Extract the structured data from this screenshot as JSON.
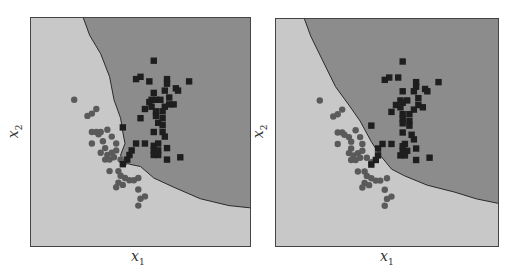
{
  "chart_data": [
    {
      "type": "scatter",
      "title": "",
      "xlabel": "x1",
      "ylabel": "x2",
      "ticks": "none",
      "grid": false,
      "legend": "none",
      "background_regions": {
        "class_circle": "#c8c8c8",
        "class_square": "#8c8c8c"
      },
      "decision_boundary": "irregular (nearest-neighbour style), jagged near clusters",
      "boundary_points": [
        [
          0.24,
          0
        ],
        [
          0.27,
          0.08
        ],
        [
          0.32,
          0.16
        ],
        [
          0.36,
          0.26
        ],
        [
          0.38,
          0.36
        ],
        [
          0.41,
          0.44
        ],
        [
          0.42,
          0.5
        ],
        [
          0.43,
          0.55
        ],
        [
          0.41,
          0.6
        ],
        [
          0.42,
          0.63
        ],
        [
          0.45,
          0.64
        ],
        [
          0.5,
          0.65
        ],
        [
          0.56,
          0.7
        ],
        [
          0.65,
          0.74
        ],
        [
          0.77,
          0.79
        ],
        [
          0.9,
          0.82
        ],
        [
          1.0,
          0.83
        ]
      ],
      "series": [
        {
          "name": "class circle",
          "marker": "circle",
          "color": "#5a5a5a",
          "points": [
            [
              0.2,
              0.36
            ],
            [
              0.26,
              0.43
            ],
            [
              0.28,
              0.42
            ],
            [
              0.3,
              0.4
            ],
            [
              0.28,
              0.5
            ],
            [
              0.3,
              0.5
            ],
            [
              0.31,
              0.51
            ],
            [
              0.32,
              0.5
            ],
            [
              0.35,
              0.49
            ],
            [
              0.28,
              0.55
            ],
            [
              0.33,
              0.54
            ],
            [
              0.37,
              0.52
            ],
            [
              0.34,
              0.57
            ],
            [
              0.39,
              0.55
            ],
            [
              0.32,
              0.59
            ],
            [
              0.35,
              0.6
            ],
            [
              0.37,
              0.59
            ],
            [
              0.39,
              0.58
            ],
            [
              0.34,
              0.62
            ],
            [
              0.36,
              0.62
            ],
            [
              0.38,
              0.61
            ],
            [
              0.41,
              0.62
            ],
            [
              0.36,
              0.67
            ],
            [
              0.4,
              0.67
            ],
            [
              0.43,
              0.63
            ],
            [
              0.41,
              0.69
            ],
            [
              0.43,
              0.7
            ],
            [
              0.45,
              0.71
            ],
            [
              0.49,
              0.7
            ],
            [
              0.47,
              0.71
            ],
            [
              0.4,
              0.72
            ],
            [
              0.39,
              0.74
            ],
            [
              0.42,
              0.73
            ],
            [
              0.49,
              0.75
            ],
            [
              0.5,
              0.79
            ],
            [
              0.52,
              0.78
            ],
            [
              0.49,
              0.82
            ]
          ]
        },
        {
          "name": "class square",
          "marker": "square",
          "color": "#1e1e1e",
          "points": [
            [
              0.56,
              0.19
            ],
            [
              0.48,
              0.27
            ],
            [
              0.5,
              0.26
            ],
            [
              0.54,
              0.28
            ],
            [
              0.62,
              0.27
            ],
            [
              0.62,
              0.29
            ],
            [
              0.72,
              0.28
            ],
            [
              0.66,
              0.31
            ],
            [
              0.67,
              0.32
            ],
            [
              0.56,
              0.33
            ],
            [
              0.61,
              0.32
            ],
            [
              0.63,
              0.35
            ],
            [
              0.55,
              0.36
            ],
            [
              0.54,
              0.37
            ],
            [
              0.57,
              0.36
            ],
            [
              0.59,
              0.36
            ],
            [
              0.63,
              0.38
            ],
            [
              0.65,
              0.38
            ],
            [
              0.61,
              0.39
            ],
            [
              0.52,
              0.4
            ],
            [
              0.55,
              0.39
            ],
            [
              0.57,
              0.41
            ],
            [
              0.6,
              0.41
            ],
            [
              0.57,
              0.43
            ],
            [
              0.6,
              0.44
            ],
            [
              0.5,
              0.44
            ],
            [
              0.58,
              0.46
            ],
            [
              0.6,
              0.47
            ],
            [
              0.42,
              0.48
            ],
            [
              0.56,
              0.5
            ],
            [
              0.6,
              0.5
            ],
            [
              0.61,
              0.52
            ],
            [
              0.58,
              0.55
            ],
            [
              0.48,
              0.55
            ],
            [
              0.52,
              0.55
            ],
            [
              0.56,
              0.56
            ],
            [
              0.56,
              0.58
            ],
            [
              0.58,
              0.58
            ],
            [
              0.62,
              0.57
            ],
            [
              0.46,
              0.58
            ],
            [
              0.45,
              0.6
            ],
            [
              0.56,
              0.6
            ],
            [
              0.58,
              0.6
            ],
            [
              0.62,
              0.62
            ],
            [
              0.68,
              0.61
            ],
            [
              0.44,
              0.62
            ],
            [
              0.42,
              0.64
            ]
          ]
        }
      ]
    },
    {
      "type": "scatter",
      "title": "",
      "xlabel": "x1",
      "ylabel": "x2",
      "ticks": "none",
      "grid": false,
      "legend": "none",
      "background_regions": {
        "class_circle": "#c8c8c8",
        "class_square": "#8c8c8c"
      },
      "decision_boundary": "smoother boundary",
      "boundary_points": [
        [
          0.13,
          0
        ],
        [
          0.16,
          0.08
        ],
        [
          0.21,
          0.18
        ],
        [
          0.27,
          0.3
        ],
        [
          0.33,
          0.38
        ],
        [
          0.38,
          0.45
        ],
        [
          0.43,
          0.54
        ],
        [
          0.47,
          0.6
        ],
        [
          0.52,
          0.66
        ],
        [
          0.58,
          0.69
        ],
        [
          0.68,
          0.73
        ],
        [
          0.8,
          0.76
        ],
        [
          0.9,
          0.79
        ],
        [
          1.0,
          0.81
        ]
      ],
      "series": [
        {
          "name": "class circle",
          "marker": "circle",
          "color": "#5a5a5a",
          "points": [
            [
              0.2,
              0.36
            ],
            [
              0.26,
              0.43
            ],
            [
              0.28,
              0.42
            ],
            [
              0.3,
              0.4
            ],
            [
              0.28,
              0.5
            ],
            [
              0.3,
              0.5
            ],
            [
              0.31,
              0.51
            ],
            [
              0.33,
              0.52
            ],
            [
              0.36,
              0.49
            ],
            [
              0.28,
              0.55
            ],
            [
              0.34,
              0.54
            ],
            [
              0.38,
              0.52
            ],
            [
              0.34,
              0.57
            ],
            [
              0.39,
              0.55
            ],
            [
              0.33,
              0.59
            ],
            [
              0.35,
              0.6
            ],
            [
              0.37,
              0.59
            ],
            [
              0.39,
              0.58
            ],
            [
              0.34,
              0.62
            ],
            [
              0.36,
              0.62
            ],
            [
              0.38,
              0.61
            ],
            [
              0.41,
              0.61
            ],
            [
              0.37,
              0.67
            ],
            [
              0.4,
              0.67
            ],
            [
              0.43,
              0.63
            ],
            [
              0.41,
              0.69
            ],
            [
              0.43,
              0.7
            ],
            [
              0.45,
              0.71
            ],
            [
              0.5,
              0.7
            ],
            [
              0.47,
              0.71
            ],
            [
              0.4,
              0.72
            ],
            [
              0.39,
              0.74
            ],
            [
              0.42,
              0.73
            ],
            [
              0.49,
              0.75
            ],
            [
              0.5,
              0.79
            ],
            [
              0.52,
              0.78
            ],
            [
              0.49,
              0.82
            ]
          ]
        },
        {
          "name": "class square",
          "marker": "square",
          "color": "#1e1e1e",
          "points": [
            [
              0.57,
              0.19
            ],
            [
              0.49,
              0.27
            ],
            [
              0.51,
              0.26
            ],
            [
              0.55,
              0.26
            ],
            [
              0.63,
              0.28
            ],
            [
              0.63,
              0.3
            ],
            [
              0.73,
              0.28
            ],
            [
              0.67,
              0.31
            ],
            [
              0.68,
              0.32
            ],
            [
              0.57,
              0.32
            ],
            [
              0.62,
              0.32
            ],
            [
              0.64,
              0.35
            ],
            [
              0.56,
              0.36
            ],
            [
              0.54,
              0.38
            ],
            [
              0.57,
              0.37
            ],
            [
              0.59,
              0.36
            ],
            [
              0.64,
              0.38
            ],
            [
              0.66,
              0.39
            ],
            [
              0.62,
              0.4
            ],
            [
              0.52,
              0.41
            ],
            [
              0.56,
              0.39
            ],
            [
              0.57,
              0.42
            ],
            [
              0.6,
              0.42
            ],
            [
              0.57,
              0.44
            ],
            [
              0.6,
              0.45
            ],
            [
              0.57,
              0.46
            ],
            [
              0.6,
              0.47
            ],
            [
              0.43,
              0.47
            ],
            [
              0.57,
              0.5
            ],
            [
              0.61,
              0.51
            ],
            [
              0.62,
              0.53
            ],
            [
              0.58,
              0.55
            ],
            [
              0.48,
              0.55
            ],
            [
              0.52,
              0.55
            ],
            [
              0.57,
              0.56
            ],
            [
              0.57,
              0.58
            ],
            [
              0.59,
              0.58
            ],
            [
              0.63,
              0.57
            ],
            [
              0.46,
              0.57
            ],
            [
              0.46,
              0.6
            ],
            [
              0.56,
              0.6
            ],
            [
              0.58,
              0.6
            ],
            [
              0.63,
              0.62
            ],
            [
              0.69,
              0.61
            ],
            [
              0.45,
              0.62
            ],
            [
              0.43,
              0.64
            ]
          ]
        }
      ]
    }
  ],
  "panels": [
    {
      "xlabel": "x",
      "xsub": "1",
      "ylabel": "x",
      "ysub": "2"
    },
    {
      "xlabel": "x",
      "xsub": "1",
      "ylabel": "x",
      "ysub": "2"
    }
  ]
}
